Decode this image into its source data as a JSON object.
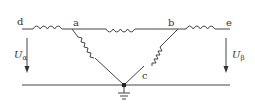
{
  "diagram": {
    "type": "circuit",
    "nodes": [
      {
        "id": "d",
        "label": "d"
      },
      {
        "id": "a",
        "label": "a"
      },
      {
        "id": "b",
        "label": "b"
      },
      {
        "id": "e",
        "label": "e"
      },
      {
        "id": "c",
        "label": "c"
      }
    ],
    "inductors": [
      {
        "from": "d",
        "to": "a"
      },
      {
        "from": "a",
        "to": "b"
      },
      {
        "from": "b",
        "to": "e"
      },
      {
        "from": "a",
        "to": "c"
      },
      {
        "from": "b",
        "to": "c"
      }
    ],
    "ground": {
      "at": "c"
    },
    "voltages": [
      {
        "symbol": "U",
        "subscript": "α",
        "side": "left"
      },
      {
        "symbol": "U",
        "subscript": "β",
        "side": "right"
      }
    ]
  }
}
